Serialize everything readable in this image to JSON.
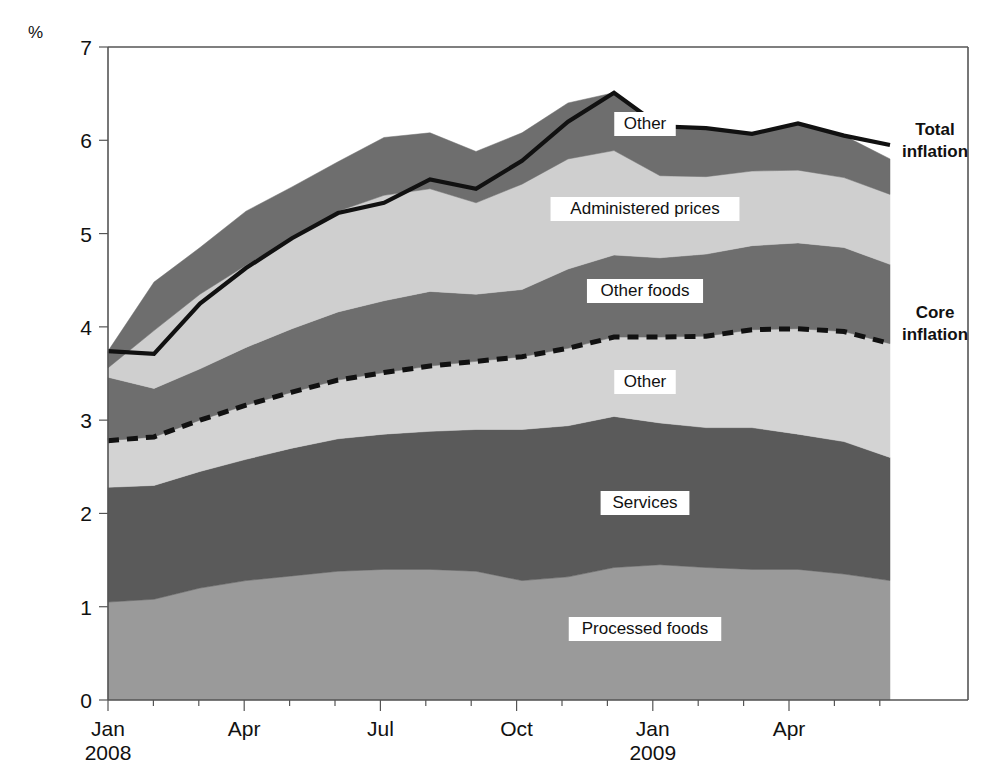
{
  "figure": {
    "unit_label": "%",
    "right_labels": [
      {
        "id": "total-inflation",
        "line1": "Total",
        "line2": "inflation",
        "x": 935,
        "y": 135
      },
      {
        "id": "core-inflation",
        "line1": "Core",
        "line2": "inflation",
        "x": 935,
        "y": 318
      }
    ]
  },
  "axes": {
    "y": {
      "min": 0,
      "max": 7,
      "ticks": [
        "0",
        "1",
        "2",
        "3",
        "4",
        "5",
        "6",
        "7"
      ],
      "tick_values": [
        0,
        1,
        2,
        3,
        4,
        5,
        6,
        7
      ],
      "px_top": 47,
      "px_bottom": 700
    },
    "x": {
      "px_left": 108,
      "px_right": 890,
      "month_step_px": 45.4,
      "tick_count": 18,
      "labels": [
        {
          "text": "Jan",
          "sub": "2008",
          "index": 0
        },
        {
          "text": "Apr",
          "sub": "",
          "index": 3
        },
        {
          "text": "Jul",
          "sub": "",
          "index": 6
        },
        {
          "text": "Oct",
          "sub": "",
          "index": 9
        },
        {
          "text": "Jan",
          "sub": "2009",
          "index": 12
        },
        {
          "text": "Apr",
          "sub": "",
          "index": 15
        }
      ]
    }
  },
  "colors": {
    "processed_foods": "#9a9a9a",
    "services": "#5a5a5a",
    "core_other": "#d3d3d3",
    "other_foods": "#6e6e6e",
    "administered_prices": "#cfcfcf",
    "top_other": "#6e6e6e",
    "total_line": "#111111",
    "core_line": "#111111",
    "frame": "#555555",
    "background": "#ffffff"
  },
  "chart_data": {
    "type": "area",
    "stacked": true,
    "title": "",
    "xlabel": "",
    "ylabel": "%",
    "ylim": [
      0,
      7
    ],
    "grid": false,
    "legend_position": "inline-labels",
    "x": [
      "Jan 2008",
      "Feb 2008",
      "Mar 2008",
      "Apr 2008",
      "May 2008",
      "Jun 2008",
      "Jul 2008",
      "Aug 2008",
      "Sep 2008",
      "Oct 2008",
      "Nov 2008",
      "Dec 2008",
      "Jan 2009",
      "Feb 2009",
      "Mar 2009",
      "Apr 2009",
      "May 2009",
      "Jun 2009"
    ],
    "categories": [
      "Jan 2008",
      "Feb 2008",
      "Mar 2008",
      "Apr 2008",
      "May 2008",
      "Jun 2008",
      "Jul 2008",
      "Aug 2008",
      "Sep 2008",
      "Oct 2008",
      "Nov 2008",
      "Dec 2008",
      "Jan 2009",
      "Feb 2009",
      "Mar 2009",
      "Apr 2009",
      "May 2009",
      "Jun 2009"
    ],
    "series": [
      {
        "name": "Processed foods",
        "label": "Processed foods",
        "color": "#9a9a9a",
        "order": 1,
        "values": [
          1.05,
          1.08,
          1.2,
          1.28,
          1.33,
          1.38,
          1.4,
          1.4,
          1.38,
          1.28,
          1.32,
          1.42,
          1.45,
          1.42,
          1.4,
          1.4,
          1.35,
          1.28
        ]
      },
      {
        "name": "Services",
        "label": "Services",
        "color": "#5a5a5a",
        "order": 2,
        "values": [
          1.23,
          1.22,
          1.25,
          1.3,
          1.37,
          1.42,
          1.45,
          1.48,
          1.52,
          1.62,
          1.62,
          1.62,
          1.52,
          1.5,
          1.52,
          1.45,
          1.42,
          1.32
        ]
      },
      {
        "name": "Other",
        "label": "Other",
        "color": "#d3d3d3",
        "order": 3,
        "values": [
          0.5,
          0.52,
          0.55,
          0.58,
          0.6,
          0.63,
          0.66,
          0.7,
          0.73,
          0.78,
          0.83,
          0.85,
          0.92,
          0.98,
          1.05,
          1.13,
          1.18,
          1.22
        ]
      },
      {
        "name": "Other foods",
        "label": "Other foods",
        "color": "#6e6e6e",
        "order": 4,
        "values": [
          0.68,
          0.52,
          0.55,
          0.62,
          0.68,
          0.73,
          0.77,
          0.8,
          0.72,
          0.72,
          0.85,
          0.88,
          0.85,
          0.88,
          0.9,
          0.92,
          0.9,
          0.85
        ]
      },
      {
        "name": "Administered prices",
        "label": "Administered prices",
        "color": "#cfcfcf",
        "order": 5,
        "values": [
          0.1,
          0.62,
          0.8,
          0.88,
          0.97,
          1.08,
          1.13,
          1.1,
          0.98,
          1.13,
          1.18,
          1.12,
          0.88,
          0.83,
          0.8,
          0.78,
          0.75,
          0.75
        ]
      },
      {
        "name": "Other",
        "label": "Other",
        "color": "#6e6e6e",
        "order": 6,
        "values": [
          0.18,
          0.52,
          0.5,
          0.58,
          0.55,
          0.53,
          0.62,
          0.6,
          0.55,
          0.55,
          0.6,
          0.62,
          0.53,
          0.52,
          0.4,
          0.5,
          0.45,
          0.38
        ]
      }
    ],
    "lines": [
      {
        "name": "Total inflation",
        "style": "solid",
        "color": "#111111",
        "values": [
          3.74,
          3.71,
          4.25,
          4.63,
          4.95,
          5.22,
          5.33,
          5.58,
          5.48,
          5.78,
          6.2,
          6.51,
          6.15,
          6.13,
          6.07,
          6.18,
          6.05,
          5.95
        ]
      },
      {
        "name": "Core inflation",
        "style": "dashed",
        "color": "#111111",
        "values": [
          2.78,
          2.82,
          3.0,
          3.16,
          3.3,
          3.43,
          3.51,
          3.58,
          3.63,
          3.68,
          3.77,
          3.89,
          3.89,
          3.9,
          3.97,
          3.98,
          3.95,
          3.82
        ]
      }
    ],
    "inline_labels": [
      {
        "text": "Other",
        "series": "top-other",
        "x_px": 645,
        "y_px": 124
      },
      {
        "text": "Administered prices",
        "series": "administered-prices",
        "x_px": 645,
        "y_px": 209
      },
      {
        "text": "Other foods",
        "series": "other-foods",
        "x_px": 645,
        "y_px": 291
      },
      {
        "text": "Other",
        "series": "core-other",
        "x_px": 645,
        "y_px": 382
      },
      {
        "text": "Services",
        "series": "services",
        "x_px": 645,
        "y_px": 503
      },
      {
        "text": "Processed foods",
        "series": "processed-foods",
        "x_px": 645,
        "y_px": 629
      }
    ]
  }
}
